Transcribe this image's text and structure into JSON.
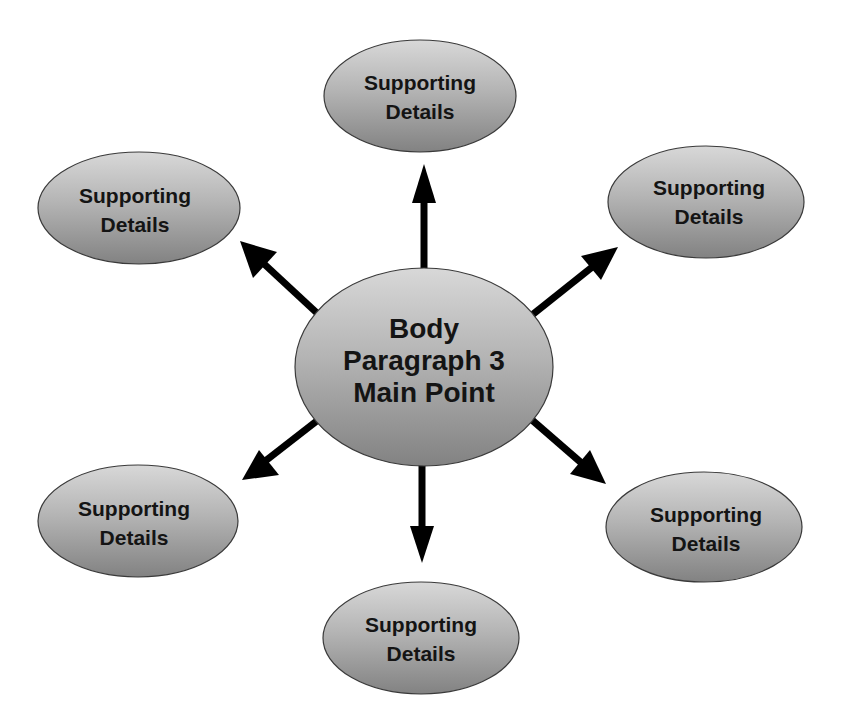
{
  "diagram": {
    "type": "mind-map",
    "colors": {
      "node_fill_top": "#d6d6d6",
      "node_fill_bottom": "#858585",
      "node_stroke": "#3a3a3a",
      "arrow": "#000000",
      "text": "#141414",
      "background": "#ffffff"
    },
    "center": {
      "lines": [
        "Body",
        "Paragraph 3",
        "Main Point"
      ]
    },
    "nodes": [
      {
        "id": "top",
        "lines": [
          "Supporting",
          "Details"
        ]
      },
      {
        "id": "upper-left",
        "lines": [
          "Supporting",
          "Details"
        ]
      },
      {
        "id": "upper-right",
        "lines": [
          "Supporting",
          "Details"
        ]
      },
      {
        "id": "lower-left",
        "lines": [
          "Supporting",
          "Details"
        ]
      },
      {
        "id": "lower-right",
        "lines": [
          "Supporting",
          "Details"
        ]
      },
      {
        "id": "bottom",
        "lines": [
          "Supporting",
          "Details"
        ]
      }
    ],
    "edges": [
      {
        "from": "center",
        "to": "top"
      },
      {
        "from": "center",
        "to": "upper-left"
      },
      {
        "from": "center",
        "to": "upper-right"
      },
      {
        "from": "center",
        "to": "lower-left"
      },
      {
        "from": "center",
        "to": "lower-right"
      },
      {
        "from": "center",
        "to": "bottom"
      }
    ]
  }
}
